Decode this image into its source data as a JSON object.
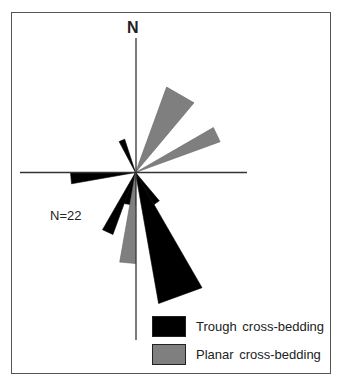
{
  "diagram": {
    "type": "rose-diagram",
    "north_label": "N",
    "count_label": "N=22",
    "center": [
      135.5,
      172.5
    ],
    "axes": {
      "vertical": {
        "from": [
          136,
          38
        ],
        "to": [
          136,
          340
        ]
      },
      "horizontal": {
        "from": [
          20,
          172.5
        ],
        "to": [
          247,
          172.5
        ]
      }
    },
    "colors": {
      "trough": "#000000",
      "planar": "#7f7f7f",
      "axis": "#333333",
      "frame": "#555555"
    }
  },
  "legend": {
    "items": [
      {
        "key": "trough",
        "label": "Trough cross-bedding",
        "color": "#000000"
      },
      {
        "key": "planar",
        "label": "Planar  cross-bedding",
        "color": "#7f7f7f"
      }
    ]
  },
  "chart_data": {
    "type": "rose",
    "title": "",
    "total_measurements": 22,
    "angle_unit": "degrees azimuth (clockwise from N)",
    "series": [
      {
        "name": "Trough cross-bedding",
        "color": "#000000",
        "petals": [
          {
            "from": 140,
            "to": 150,
            "radius": 37
          },
          {
            "from": 150,
            "to": 170,
            "radius": 133
          },
          {
            "from": 180,
            "to": 200,
            "radius": 33
          },
          {
            "from": 200,
            "to": 210,
            "radius": 66
          },
          {
            "from": 260,
            "to": 270,
            "radius": 65
          },
          {
            "from": 332,
            "to": 342,
            "radius": 35
          }
        ]
      },
      {
        "name": "Planar cross-bedding",
        "color": "#7f7f7f",
        "petals": [
          {
            "from": 20,
            "to": 40,
            "radius": 91
          },
          {
            "from": 60,
            "to": 70,
            "radius": 90
          },
          {
            "from": 180,
            "to": 190,
            "radius": 91
          }
        ]
      }
    ]
  }
}
